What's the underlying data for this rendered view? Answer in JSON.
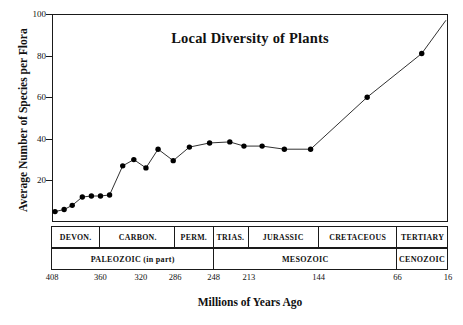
{
  "chart_data": {
    "type": "line",
    "title": "Local Diversity of Plants",
    "xlabel": "Millions of Years Ago",
    "ylabel": "Average Number of Species per Flora",
    "xlim": [
      408,
      16
    ],
    "ylim": [
      0,
      100
    ],
    "x_inverted": true,
    "grid": false,
    "legend": "none",
    "yticks": [
      0,
      20,
      40,
      60,
      80,
      100
    ],
    "ytick_labels": [
      "",
      "20",
      "40",
      "60",
      "80",
      "100"
    ],
    "xticks": [
      408,
      360,
      320,
      286,
      248,
      213,
      144,
      66,
      16
    ],
    "xtick_labels": [
      "408",
      "360",
      "320",
      "286",
      "248",
      "213",
      "144",
      "66",
      "16"
    ],
    "marker": "filled-circle",
    "series": [
      {
        "name": "Average number of species per flora",
        "x": [
          405,
          396,
          388,
          378,
          369,
          360,
          351,
          338,
          327,
          315,
          303,
          288,
          272,
          252,
          232,
          218,
          200,
          178,
          152,
          96,
          42
        ],
        "y": [
          5,
          6,
          8,
          12,
          12.5,
          12.5,
          13,
          27,
          30,
          26,
          35,
          29.5,
          36,
          38,
          38.5,
          36.5,
          36.5,
          35,
          35,
          60,
          81
        ],
        "n_points": 21
      }
    ],
    "endpoint_no_marker": {
      "x": 18,
      "y": 97,
      "note": "line continues to upper right corner without marker"
    }
  },
  "geologic_scale": {
    "periods": [
      {
        "label": "DEVON.",
        "start": 408,
        "end": 360
      },
      {
        "label": "CARBON.",
        "start": 360,
        "end": 286
      },
      {
        "label": "PERM.",
        "start": 286,
        "end": 248
      },
      {
        "label": "TRIAS.",
        "start": 248,
        "end": 213
      },
      {
        "label": "JURASSIC",
        "start": 213,
        "end": 144
      },
      {
        "label": "CRETACEOUS",
        "start": 144,
        "end": 66
      },
      {
        "label": "TERTIARY",
        "start": 66,
        "end": 16
      }
    ],
    "eras": [
      {
        "label": "PALEOZOIC (in part)",
        "start": 408,
        "end": 248
      },
      {
        "label": "MESOZOIC",
        "start": 248,
        "end": 66
      },
      {
        "label": "CENOZOIC",
        "start": 66,
        "end": 16
      }
    ]
  },
  "style": {
    "line_color": "#1a1a1a",
    "marker_color": "#000000",
    "frame_color": "#1a1a1a",
    "background": "#ffffff"
  }
}
